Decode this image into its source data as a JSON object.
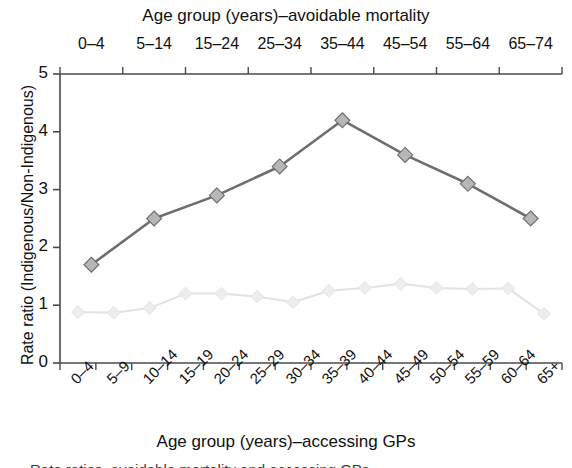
{
  "figure": {
    "top_axis_title": "Age group (years)–avoidable mortality",
    "bottom_axis_title": "Age group (years)–accessing GPs",
    "y_axis_title": "Rate ratio (Indigenous/Non-Indigenous)",
    "caption_fragment": "Rate ratios, avoidable mortality and accessing GPs",
    "colors": {
      "avoidable_mortality_line": "#6e6e6e",
      "avoidable_mortality_marker": "#b6b6b6",
      "accessing_gps_line": "#e3e3e3",
      "accessing_gps_marker": "#ededed",
      "axis": "#4a4a4a",
      "text": "#111111"
    }
  },
  "chart_data": {
    "type": "line",
    "title": "",
    "xlabel": "Age group (years)–accessing GPs",
    "xlabel_top": "Age group (years)–avoidable mortality",
    "ylabel": "Rate ratio (Indigenous/Non-Indigenous)",
    "ylim": [
      0,
      5
    ],
    "yticks": [
      0,
      1,
      2,
      3,
      4,
      5
    ],
    "ytick_labels": [
      "0",
      "1",
      "2",
      "3",
      "4",
      "5"
    ],
    "grid": false,
    "legend": "none",
    "categories_top": [
      "0–4",
      "5–14",
      "15–24",
      "25–34",
      "35–44",
      "45–54",
      "55–64",
      "65–74"
    ],
    "categories_bottom": [
      "0–4",
      "5–9",
      "10–14",
      "15–19",
      "20–24",
      "25–29",
      "30–34",
      "35–39",
      "40–44",
      "45–49",
      "50–54",
      "55–59",
      "60–64",
      "65+"
    ],
    "series": [
      {
        "name": "Avoidable mortality",
        "axis": "top",
        "categories": [
          "0–4",
          "5–14",
          "15–24",
          "25–34",
          "35–44",
          "45–54",
          "55–64",
          "65–74"
        ],
        "values": [
          1.7,
          2.5,
          2.9,
          3.4,
          4.2,
          3.6,
          3.1,
          2.5
        ],
        "color": "#6e6e6e",
        "marker": "diamond",
        "marker_color": "#b6b6b6"
      },
      {
        "name": "Accessing GPs",
        "axis": "bottom",
        "categories": [
          "0–4",
          "5–9",
          "10–14",
          "15–19",
          "20–24",
          "25–29",
          "30–34",
          "35–39",
          "40–44",
          "45–49",
          "50–54",
          "55–59",
          "60–64",
          "65+"
        ],
        "values": [
          0.88,
          0.87,
          0.95,
          1.2,
          1.2,
          1.15,
          1.05,
          1.25,
          1.3,
          1.37,
          1.3,
          1.28,
          1.29,
          0.85
        ],
        "color": "#e3e3e3",
        "marker": "diamond",
        "marker_color": "#ededed"
      }
    ]
  }
}
